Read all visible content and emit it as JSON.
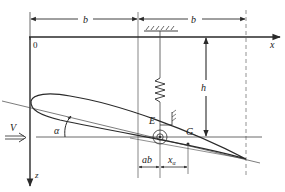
{
  "diagram": {
    "type": "airfoil-spring-mount-schematic",
    "labels": {
      "origin": "0",
      "x_axis": "x",
      "z_axis": "z",
      "b_left": "b",
      "b_right": "b",
      "h": "h",
      "V": "V",
      "alpha": "α",
      "E": "E",
      "G": "G",
      "ab": "ab",
      "x_alpha": "x",
      "x_alpha_sub": "α"
    },
    "colors": {
      "line": "#2a2a2a",
      "thin_line": "#555555",
      "dashed": "#777777",
      "background": "#ffffff"
    }
  }
}
